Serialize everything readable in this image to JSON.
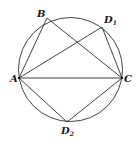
{
  "diagram": {
    "type": "inscribed-geometry",
    "points": [
      {
        "id": "A",
        "label": "A",
        "subscript": ""
      },
      {
        "id": "B",
        "label": "B",
        "subscript": ""
      },
      {
        "id": "C",
        "label": "C",
        "subscript": ""
      },
      {
        "id": "D1",
        "label": "D",
        "subscript": "1"
      },
      {
        "id": "D2",
        "label": "D",
        "subscript": "2"
      }
    ],
    "segments": [
      [
        "A",
        "B"
      ],
      [
        "B",
        "C"
      ],
      [
        "A",
        "C"
      ],
      [
        "A",
        "D1"
      ],
      [
        "D1",
        "C"
      ],
      [
        "A",
        "D2"
      ],
      [
        "D2",
        "C"
      ]
    ],
    "colors": {
      "stroke": "#2b2b2b",
      "background": "#ffffff"
    }
  }
}
